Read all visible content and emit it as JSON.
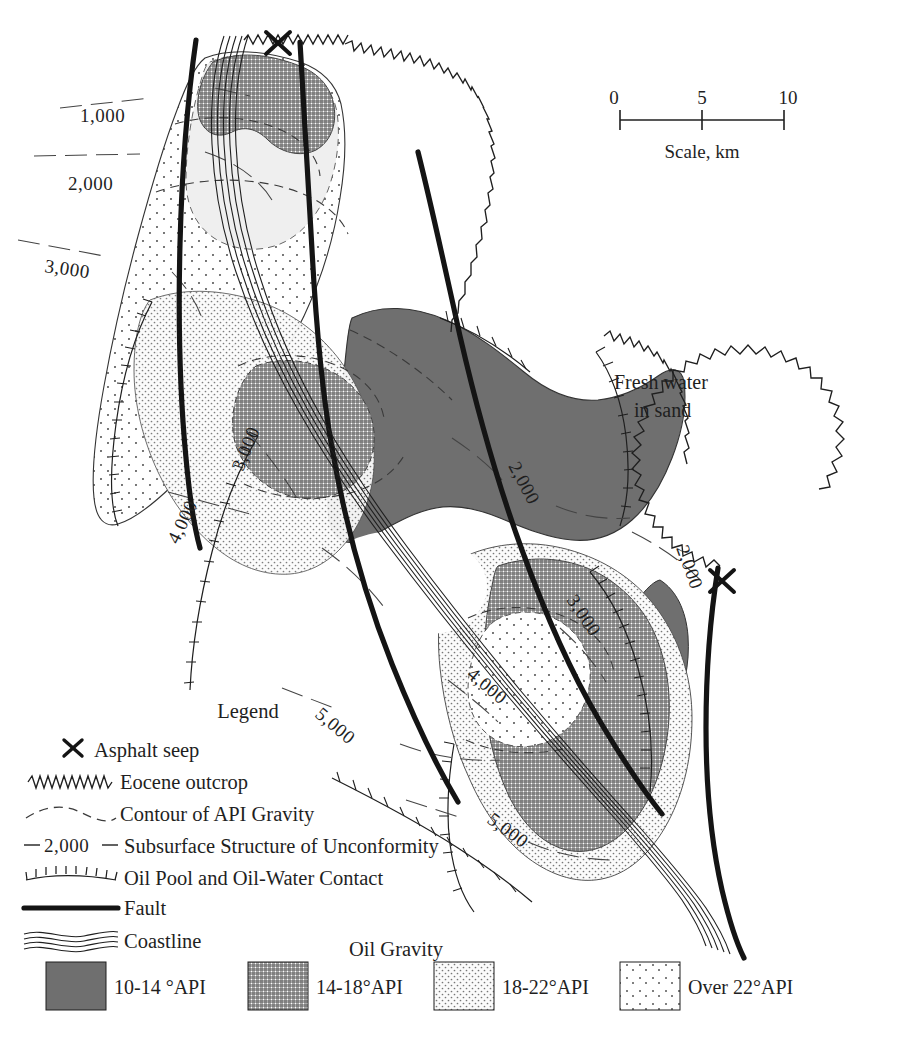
{
  "figure": {
    "type": "geological-map"
  },
  "scale_bar": {
    "ticks": [
      "0",
      "5",
      "10"
    ],
    "label": "Scale, km",
    "units": "km"
  },
  "annotations": {
    "fresh_water_line1": "Fresh water",
    "fresh_water_line2": "in sand"
  },
  "contour_labels": [
    {
      "id": "c1",
      "text": "1,000"
    },
    {
      "id": "c2",
      "text": "2,000"
    },
    {
      "id": "c3",
      "text": "3,000"
    },
    {
      "id": "c4",
      "text": "2,000"
    },
    {
      "id": "c5",
      "text": "3,000"
    },
    {
      "id": "c6",
      "text": "4,000"
    },
    {
      "id": "c7",
      "text": "2,000"
    },
    {
      "id": "c8",
      "text": "3,000"
    },
    {
      "id": "c9",
      "text": "4,000"
    },
    {
      "id": "c10",
      "text": "5,000"
    },
    {
      "id": "c11",
      "text": "5,000"
    }
  ],
  "legend": {
    "title": "Legend",
    "items": [
      {
        "symbol": "asphalt-seep-x",
        "label": "Asphalt seep"
      },
      {
        "symbol": "eocene-outcrop-zigzag",
        "label": "Eocene outcrop"
      },
      {
        "symbol": "api-gravity-dashed",
        "label": "Contour of API Gravity"
      },
      {
        "symbol": "subsurface-structure-contour",
        "label": "Subsurface Structure of Unconformity",
        "inline_value": "2,000"
      },
      {
        "symbol": "oil-pool-ticks",
        "label": "Oil Pool and Oil-Water Contact"
      },
      {
        "symbol": "fault-thick-line",
        "label": "Fault"
      },
      {
        "symbol": "coastline-wavy",
        "label": "Coastline"
      }
    ]
  },
  "oil_gravity_legend": {
    "title": "Oil Gravity",
    "classes": [
      {
        "label": "10-14 °API",
        "fill": "#6f6f6f",
        "pattern": "solid-dark"
      },
      {
        "label": "14-18°API",
        "fill": "#b9b9b9",
        "pattern": "crosshatch"
      },
      {
        "label": "18-22°API",
        "fill": "#dedede",
        "pattern": "fine-dots"
      },
      {
        "label": "Over 22°API",
        "fill": "#f4f4f4",
        "pattern": "sparse-dots"
      }
    ]
  },
  "colors": {
    "ink": "#1f1f1f",
    "dark_gray": "#6f6f6f",
    "mid_gray": "#b9b9b9",
    "light_gray": "#dedede",
    "very_light_gray": "#f6f6f6",
    "background": "#ffffff"
  }
}
